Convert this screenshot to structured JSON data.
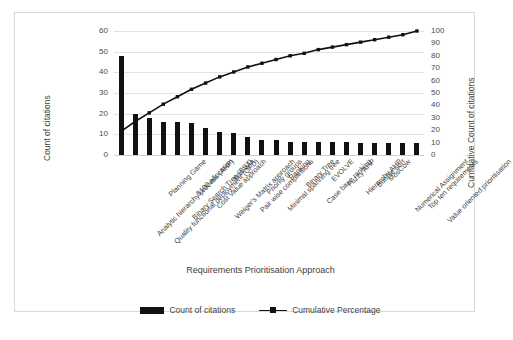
{
  "chart_data": {
    "type": "bar",
    "title": "",
    "xlabel": "Requirements Prioritisation Approach",
    "ylabel": "Count of citations",
    "y2label": "Cumulative Count of citations",
    "grid": true,
    "legend_position": "bottom",
    "ylim": [
      0,
      60
    ],
    "y2lim": [
      0,
      100
    ],
    "yticks": [
      0,
      10,
      20,
      30,
      40,
      50,
      60
    ],
    "y2ticks": [
      0,
      10,
      20,
      30,
      40,
      50,
      60,
      70,
      80,
      90,
      100
    ],
    "categories": [
      "Analytic hierarchy process (AHP)",
      "Quality functional deployment (QFD)",
      "Planning Game",
      "Binary Search Tree (BST)",
      "$100 allocation",
      "Cost Value approach",
      "Weiger's Matrix approach",
      "Win Win",
      "Pair wise comparisons",
      "Priority groups",
      "Minimal spanning tree",
      "Ranking",
      "Binary Tree",
      "Case base ranking",
      "EVOLVE",
      "Fuzzy AHP",
      "Hierarchy AHP",
      "Bubble sort",
      "MosCow",
      "Numerical Assignment",
      "Top ten requirements",
      "Value oriented prioritisation"
    ],
    "series": [
      {
        "name": "Count of citations",
        "type": "bar",
        "axis": "left",
        "color": "#111111",
        "values": [
          48,
          20,
          18,
          16,
          16,
          15.5,
          13,
          11,
          10.5,
          8.5,
          7.5,
          7.5,
          6.5,
          6.5,
          6.5,
          6.5,
          6.5,
          6,
          6,
          6,
          6,
          6
        ]
      },
      {
        "name": "Cumulative Percentage",
        "type": "line",
        "axis": "right",
        "color": "#111111",
        "values": [
          19,
          27,
          34,
          41,
          47,
          53,
          58,
          63,
          67,
          71,
          74,
          77,
          80,
          82,
          85,
          87,
          89,
          91,
          93,
          95,
          97,
          100
        ]
      }
    ],
    "legend": [
      "Count of citations",
      "Cumulative Percentage"
    ]
  }
}
